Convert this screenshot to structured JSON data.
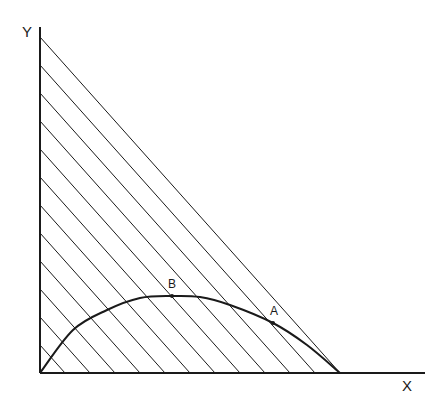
{
  "diagram": {
    "type": "geometric-plot",
    "axes": {
      "x_label": "X",
      "y_label": "Y",
      "origin": [
        40,
        373
      ],
      "x_end": [
        425,
        373
      ],
      "y_end": [
        40,
        27
      ]
    },
    "triangle": {
      "vertices": [
        [
          40,
          373
        ],
        [
          40,
          37
        ],
        [
          340,
          373
        ]
      ],
      "hatch_lines": 12,
      "hatch_y_intercepts": [
        345,
        317,
        289,
        261,
        233,
        205,
        177,
        149,
        121,
        93,
        65,
        37
      ],
      "hatch_x_intercepts": [
        65,
        90,
        115,
        140,
        165,
        190,
        215,
        240,
        265,
        290,
        315,
        340
      ]
    },
    "curve": {
      "points": [
        [
          40,
          373
        ],
        [
          73,
          330
        ],
        [
          107,
          310
        ],
        [
          140,
          298
        ],
        [
          172,
          296
        ],
        [
          200,
          297
        ],
        [
          230,
          305
        ],
        [
          273,
          323
        ],
        [
          307,
          345
        ],
        [
          340,
          373
        ]
      ]
    },
    "points": [
      {
        "label": "B",
        "x": 172,
        "y": 296,
        "label_x": 172,
        "label_y": 290
      },
      {
        "label": "A",
        "x": 273,
        "y": 323,
        "label_x": 274,
        "label_y": 317
      }
    ],
    "colors": {
      "stroke": "#1a1a1a",
      "background": "#ffffff"
    }
  }
}
